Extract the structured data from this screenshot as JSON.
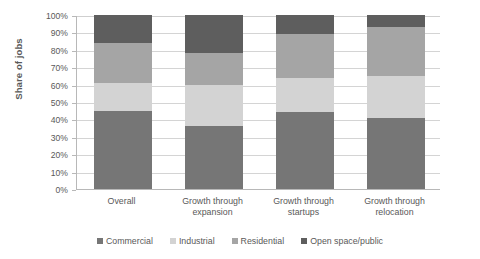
{
  "chart_data": {
    "type": "bar",
    "subtype": "100% stacked column",
    "title": "",
    "xlabel": "",
    "ylabel": "Share of jobs",
    "ylim": [
      0,
      100
    ],
    "grid": true,
    "legend_position": "bottom",
    "categories": [
      "Overall",
      "Growth through expansion",
      "Growth through startups",
      "Growth through relocation"
    ],
    "category_lines": [
      [
        "Overall",
        ""
      ],
      [
        "Growth through",
        "expansion"
      ],
      [
        "Growth through",
        "startups"
      ],
      [
        "Growth through",
        "relocation"
      ]
    ],
    "y_ticks": [
      "0%",
      "10%",
      "20%",
      "30%",
      "40%",
      "50%",
      "60%",
      "70%",
      "80%",
      "90%",
      "100%"
    ],
    "series": [
      {
        "name": "Commercial",
        "color": "#767676",
        "values": [
          45,
          36,
          44,
          41
        ]
      },
      {
        "name": "Industrial",
        "color": "#d3d3d3",
        "values": [
          16,
          24,
          20,
          24
        ]
      },
      {
        "name": "Residential",
        "color": "#a5a5a5",
        "values": [
          23,
          18,
          25,
          28
        ]
      },
      {
        "name": "Open space/public",
        "color": "#5e5e5e",
        "values": [
          16,
          22,
          11,
          7
        ]
      }
    ]
  },
  "axis": {
    "y_title": "Share of jobs"
  },
  "legend": {
    "items": [
      {
        "label": "Commercial",
        "color": "#767676"
      },
      {
        "label": "Industrial",
        "color": "#d3d3d3"
      },
      {
        "label": "Residential",
        "color": "#a5a5a5"
      },
      {
        "label": "Open space/public",
        "color": "#5e5e5e"
      }
    ]
  }
}
